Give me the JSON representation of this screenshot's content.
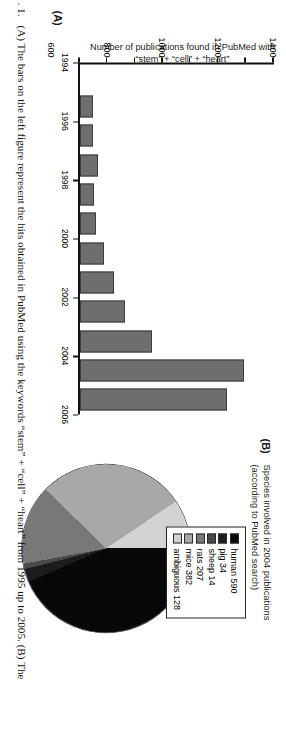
{
  "figure": {
    "caption_number": ". 1.",
    "caption_text": "(A) The bars on the left figure represent the hits obtained in PubMed using the keywords “stem” + “cell” + “heart” from 1995 up to 2005. (B) The"
  },
  "panel_a": {
    "tag": "(A)",
    "ylabel": "Number of publications found in PubMed with “stem” + “cell” + “heart”"
  },
  "panel_b": {
    "tag": "(B)",
    "title_line1": "Species involved in 2004 publications",
    "title_line2": "(according to PubMed search)",
    "legend": [
      {
        "label": "human 590",
        "color": "#080808"
      },
      {
        "label": "pig 34",
        "color": "#1c1c1c"
      },
      {
        "label": "sheep 14",
        "color": "#4a4a4a"
      },
      {
        "label": "rats 207",
        "color": "#787878"
      },
      {
        "label": "mice 382",
        "color": "#a8a8a8"
      },
      {
        "label": "ambiguous 128",
        "color": "#d2d2d2"
      }
    ]
  },
  "chart_data": [
    {
      "type": "bar",
      "title": "Number of publications found in PubMed with “stem” + “cell” + “heart”",
      "xlabel": "",
      "ylabel": "Number of publications found in PubMed with “stem” + “cell” + “heart”",
      "categories": [
        1995,
        1996,
        1997,
        1998,
        1999,
        2000,
        2001,
        2002,
        2003,
        2004,
        2005
      ],
      "values": [
        95,
        100,
        130,
        105,
        120,
        175,
        250,
        330,
        520,
        1190,
        1065
      ],
      "xtick_labels": [
        "1994",
        "1996",
        "1998",
        "2000",
        "2002",
        "2004",
        "2006"
      ],
      "xlim": [
        1994,
        2006
      ],
      "ytick_labels": [
        "0",
        "200",
        "400",
        "600",
        "800",
        "1000",
        "1200",
        "1400"
      ],
      "ylim": [
        0,
        1400
      ],
      "grid": false,
      "bar_color": "#6e6e6e"
    },
    {
      "type": "pie",
      "title": "Species involved in 2004 publications (according to PubMed search)",
      "labels": [
        "human",
        "pig",
        "sheep",
        "rats",
        "mice",
        "ambiguous"
      ],
      "values": [
        590,
        34,
        14,
        207,
        382,
        128
      ],
      "total": 1355,
      "colors": [
        "#080808",
        "#1c1c1c",
        "#4a4a4a",
        "#787878",
        "#a8a8a8",
        "#d2d2d2"
      ],
      "legend_position": "top-right",
      "start_angle_deg": 0,
      "direction": "clockwise"
    }
  ]
}
